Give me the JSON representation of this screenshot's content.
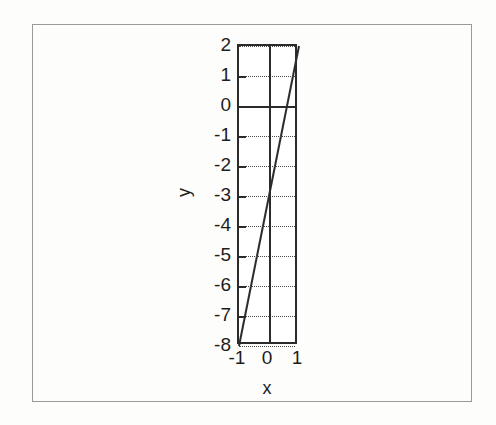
{
  "figure": {
    "background_color": "#fdfdfc",
    "ink_color": "#1d1d1d",
    "frame_color": "#9a9a9a"
  },
  "chart_data": {
    "type": "line",
    "title": "",
    "xlabel": "x",
    "ylabel": "y",
    "xlim": [
      -1,
      1
    ],
    "ylim": [
      -8,
      2
    ],
    "xticks": [
      -1,
      0,
      1
    ],
    "xtick_labels": [
      "-1",
      "0",
      "1"
    ],
    "yticks": [
      2,
      1,
      0,
      -1,
      -2,
      -3,
      -4,
      -5,
      -6,
      -7,
      -8
    ],
    "ytick_labels": [
      "2",
      "1",
      "0",
      "-1",
      "-2",
      "-3",
      "-4",
      "-5",
      "-6",
      "-7",
      "-8"
    ],
    "grid": true,
    "grid_style": "dotted",
    "legend": "none",
    "series": [
      {
        "name": "y = 5x - 3",
        "color": "#2b2b2b",
        "x": [
          -1,
          0,
          1
        ],
        "values": [
          -8,
          -3,
          2
        ]
      }
    ],
    "annotations": []
  }
}
